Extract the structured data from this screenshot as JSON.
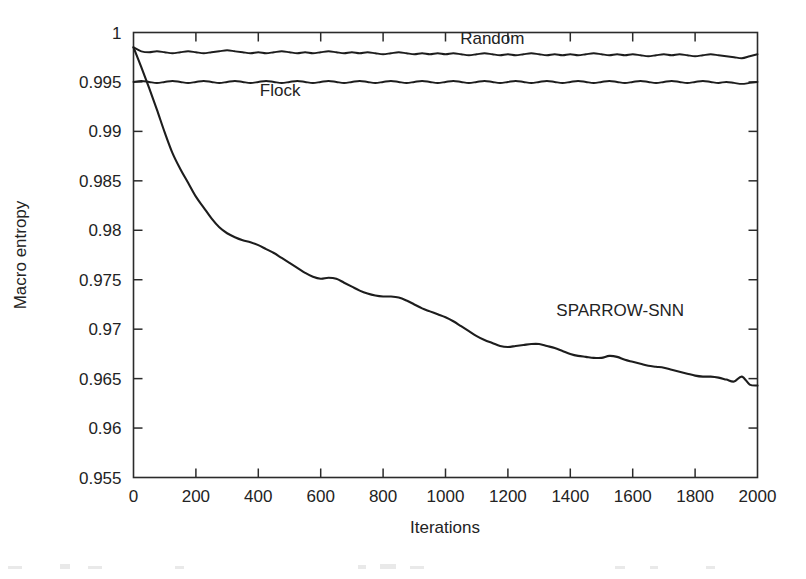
{
  "chart_data": {
    "type": "line",
    "title": "",
    "xlabel": "Iterations",
    "ylabel": "Macro entropy",
    "xlim": [
      0,
      2000
    ],
    "ylim": [
      0.955,
      1
    ],
    "xticks": [
      0,
      200,
      400,
      600,
      800,
      1000,
      1200,
      1400,
      1600,
      1800,
      2000
    ],
    "xtick_labels": [
      "0",
      "200",
      "400",
      "600",
      "800",
      "1000",
      "1200",
      "1400",
      "1600",
      "1800",
      "2000"
    ],
    "yticks": [
      0.955,
      0.96,
      0.965,
      0.97,
      0.975,
      0.98,
      0.985,
      0.99,
      0.995,
      1
    ],
    "ytick_labels": [
      "0.955",
      "0.96",
      "0.965",
      "0.97",
      "0.975",
      "0.98",
      "0.985",
      "0.99",
      "0.995",
      "1"
    ],
    "grid": false,
    "legend_position": "inline-annotations",
    "line_color": "#1d1d1d",
    "x": [
      0,
      25,
      50,
      75,
      100,
      125,
      150,
      175,
      200,
      225,
      250,
      275,
      300,
      325,
      350,
      375,
      400,
      425,
      450,
      475,
      500,
      525,
      550,
      575,
      600,
      625,
      650,
      675,
      700,
      725,
      750,
      775,
      800,
      825,
      850,
      875,
      900,
      925,
      950,
      975,
      1000,
      1025,
      1050,
      1075,
      1100,
      1125,
      1150,
      1175,
      1200,
      1225,
      1250,
      1275,
      1300,
      1325,
      1350,
      1375,
      1400,
      1425,
      1450,
      1475,
      1500,
      1525,
      1550,
      1575,
      1600,
      1625,
      1650,
      1675,
      1700,
      1725,
      1750,
      1775,
      1800,
      1825,
      1850,
      1875,
      1900,
      1925,
      1950,
      1975,
      2000
    ],
    "series": [
      {
        "name": "Random",
        "label": "Random",
        "label_x": 1150,
        "label_y": 0.9988,
        "values": [
          0.9985,
          0.9981,
          0.998,
          0.9981,
          0.998,
          0.9979,
          0.998,
          0.9981,
          0.998,
          0.9979,
          0.998,
          0.9981,
          0.9982,
          0.9981,
          0.998,
          0.9979,
          0.998,
          0.9979,
          0.998,
          0.9981,
          0.998,
          0.9979,
          0.998,
          0.9979,
          0.998,
          0.9981,
          0.998,
          0.9979,
          0.998,
          0.9979,
          0.998,
          0.9979,
          0.9978,
          0.9979,
          0.998,
          0.9979,
          0.9978,
          0.9979,
          0.9978,
          0.9979,
          0.9978,
          0.9979,
          0.9978,
          0.9977,
          0.9978,
          0.9979,
          0.9978,
          0.9977,
          0.9978,
          0.9977,
          0.9978,
          0.9979,
          0.9978,
          0.9977,
          0.9978,
          0.9977,
          0.9978,
          0.9977,
          0.9978,
          0.9979,
          0.9978,
          0.9977,
          0.9978,
          0.9977,
          0.9978,
          0.9977,
          0.9976,
          0.9977,
          0.9978,
          0.9977,
          0.9978,
          0.9977,
          0.9976,
          0.9977,
          0.9978,
          0.9977,
          0.9976,
          0.9975,
          0.9974,
          0.9976,
          0.9978
        ]
      },
      {
        "name": "Flock",
        "label": "Flock",
        "label_x": 470,
        "label_y": 0.9936,
        "values": [
          0.995,
          0.9951,
          0.995,
          0.9949,
          0.995,
          0.9951,
          0.995,
          0.9949,
          0.995,
          0.9951,
          0.995,
          0.9949,
          0.995,
          0.9951,
          0.995,
          0.9949,
          0.995,
          0.9951,
          0.995,
          0.9949,
          0.995,
          0.9951,
          0.995,
          0.9949,
          0.995,
          0.9951,
          0.995,
          0.9949,
          0.995,
          0.9951,
          0.995,
          0.9949,
          0.995,
          0.9951,
          0.995,
          0.9949,
          0.995,
          0.9951,
          0.995,
          0.9949,
          0.995,
          0.9951,
          0.995,
          0.9949,
          0.995,
          0.9951,
          0.995,
          0.9949,
          0.995,
          0.9951,
          0.995,
          0.9949,
          0.995,
          0.9951,
          0.995,
          0.9949,
          0.995,
          0.9951,
          0.995,
          0.9949,
          0.995,
          0.9951,
          0.995,
          0.9949,
          0.995,
          0.9951,
          0.995,
          0.9949,
          0.995,
          0.9951,
          0.995,
          0.9949,
          0.995,
          0.9951,
          0.995,
          0.9949,
          0.995,
          0.9949,
          0.9948,
          0.9949,
          0.995
        ]
      },
      {
        "name": "SPARROW-SNN",
        "label": "SPARROW-SNN",
        "label_x": 1560,
        "label_y": 0.9713,
        "values": [
          0.9985,
          0.9965,
          0.9944,
          0.9922,
          0.9899,
          0.9878,
          0.9862,
          0.9848,
          0.9834,
          0.9823,
          0.9812,
          0.9803,
          0.9797,
          0.9793,
          0.979,
          0.9788,
          0.9785,
          0.9781,
          0.9777,
          0.9772,
          0.9767,
          0.9762,
          0.9757,
          0.9753,
          0.9751,
          0.9752,
          0.9751,
          0.9747,
          0.9743,
          0.9739,
          0.9736,
          0.9734,
          0.9733,
          0.9733,
          0.9732,
          0.9729,
          0.9725,
          0.9721,
          0.9718,
          0.9715,
          0.9712,
          0.9708,
          0.9703,
          0.9698,
          0.9693,
          0.9689,
          0.9686,
          0.9683,
          0.9682,
          0.9683,
          0.9684,
          0.9685,
          0.9685,
          0.9683,
          0.9681,
          0.9678,
          0.9675,
          0.9673,
          0.9672,
          0.9671,
          0.9671,
          0.9673,
          0.9672,
          0.9669,
          0.9667,
          0.9665,
          0.9663,
          0.9662,
          0.9661,
          0.9659,
          0.9657,
          0.9655,
          0.9653,
          0.9652,
          0.9652,
          0.9651,
          0.9649,
          0.9647,
          0.9652,
          0.9644,
          0.9643
        ]
      }
    ]
  }
}
